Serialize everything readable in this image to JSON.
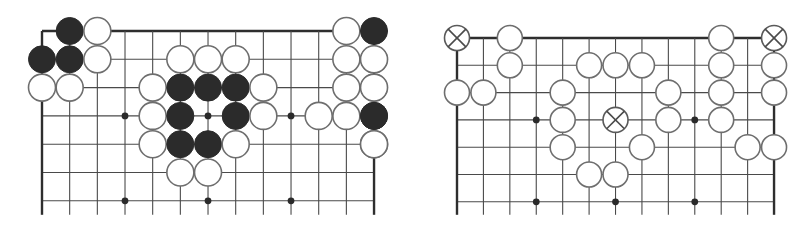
{
  "figure": {
    "colors": {
      "background": "#ffffff",
      "line": "#4a4a4a",
      "edge": "#2e2e2e",
      "black_stone": "#2b2b2b",
      "white_stone_fill": "#ffffff",
      "white_stone_stroke": "#6e6e6e"
    }
  },
  "boards": [
    {
      "name": "left-board",
      "cols": 13,
      "rows": 7,
      "origin_x": 42,
      "origin_y": 31,
      "dx": 27.67,
      "dy": 28.3,
      "line_extend_bottom": 14,
      "stone_radius": 13.5,
      "edges": [
        "top",
        "left",
        "right"
      ],
      "star_points": [
        [
          3,
          3
        ],
        [
          6,
          3
        ],
        [
          9,
          3
        ],
        [
          3,
          6
        ],
        [
          6,
          6
        ],
        [
          9,
          6
        ]
      ],
      "stones": [
        {
          "c": 1,
          "r": 0,
          "color": "black"
        },
        {
          "c": 2,
          "r": 0,
          "color": "white"
        },
        {
          "c": 11,
          "r": 0,
          "color": "white"
        },
        {
          "c": 12,
          "r": 0,
          "color": "black"
        },
        {
          "c": 0,
          "r": 1,
          "color": "black"
        },
        {
          "c": 1,
          "r": 1,
          "color": "black"
        },
        {
          "c": 2,
          "r": 1,
          "color": "white"
        },
        {
          "c": 5,
          "r": 1,
          "color": "white"
        },
        {
          "c": 6,
          "r": 1,
          "color": "white"
        },
        {
          "c": 7,
          "r": 1,
          "color": "white"
        },
        {
          "c": 11,
          "r": 1,
          "color": "white"
        },
        {
          "c": 12,
          "r": 1,
          "color": "black"
        },
        {
          "c": 13,
          "r": 1,
          "color": "white"
        },
        {
          "c": 0,
          "r": 2,
          "color": "white"
        },
        {
          "c": 1,
          "r": 2,
          "color": "white"
        },
        {
          "c": 4,
          "r": 2,
          "color": "white"
        },
        {
          "c": 5,
          "r": 2,
          "color": "black"
        },
        {
          "c": 6,
          "r": 2,
          "color": "black"
        },
        {
          "c": 7,
          "r": 2,
          "color": "black"
        },
        {
          "c": 8,
          "r": 2,
          "color": "white"
        },
        {
          "c": 11,
          "r": 2,
          "color": "white"
        },
        {
          "c": 12,
          "r": 2,
          "color": "black"
        },
        {
          "c": 13,
          "r": 2,
          "color": "white"
        },
        {
          "c": 4,
          "r": 3,
          "color": "white"
        },
        {
          "c": 5,
          "r": 3,
          "color": "black"
        },
        {
          "c": 7,
          "r": 3,
          "color": "black"
        },
        {
          "c": 8,
          "r": 3,
          "color": "white"
        },
        {
          "c": 10,
          "r": 3,
          "color": "white"
        },
        {
          "c": 11,
          "r": 3,
          "color": "white"
        },
        {
          "c": 12,
          "r": 3,
          "color": "black"
        },
        {
          "c": 13,
          "r": 3,
          "color": "black"
        },
        {
          "c": 4,
          "r": 4,
          "color": "white"
        },
        {
          "c": 5,
          "r": 4,
          "color": "black"
        },
        {
          "c": 6,
          "r": 4,
          "color": "black"
        },
        {
          "c": 7,
          "r": 4,
          "color": "white"
        },
        {
          "c": 12,
          "r": 4,
          "color": "white"
        },
        {
          "c": 13,
          "r": 4,
          "color": "white"
        },
        {
          "c": 5,
          "r": 5,
          "color": "white"
        },
        {
          "c": 6,
          "r": 5,
          "color": "white"
        }
      ]
    },
    {
      "name": "right-board",
      "cols": 13,
      "rows": 7,
      "origin_x": 457,
      "origin_y": 38,
      "dx": 26.42,
      "dy": 27.3,
      "line_extend_bottom": 13,
      "stone_radius": 12.5,
      "edges": [
        "top",
        "left",
        "right"
      ],
      "star_points": [
        [
          3,
          3
        ],
        [
          6,
          3
        ],
        [
          9,
          3
        ],
        [
          3,
          6
        ],
        [
          6,
          6
        ],
        [
          9,
          6
        ]
      ],
      "stones": [
        {
          "c": 0,
          "r": 0,
          "color": "cross"
        },
        {
          "c": 2,
          "r": 0,
          "color": "white"
        },
        {
          "c": 10,
          "r": 0,
          "color": "white"
        },
        {
          "c": 12,
          "r": 0,
          "color": "cross"
        },
        {
          "c": 2,
          "r": 1,
          "color": "white"
        },
        {
          "c": 5,
          "r": 1,
          "color": "white"
        },
        {
          "c": 6,
          "r": 1,
          "color": "white"
        },
        {
          "c": 7,
          "r": 1,
          "color": "white"
        },
        {
          "c": 10,
          "r": 1,
          "color": "white"
        },
        {
          "c": 12,
          "r": 1,
          "color": "white"
        },
        {
          "c": 0,
          "r": 2,
          "color": "white"
        },
        {
          "c": 1,
          "r": 2,
          "color": "white"
        },
        {
          "c": 4,
          "r": 2,
          "color": "white"
        },
        {
          "c": 8,
          "r": 2,
          "color": "white"
        },
        {
          "c": 10,
          "r": 2,
          "color": "white"
        },
        {
          "c": 12,
          "r": 2,
          "color": "white"
        },
        {
          "c": 4,
          "r": 3,
          "color": "white"
        },
        {
          "c": 6,
          "r": 3,
          "color": "cross"
        },
        {
          "c": 8,
          "r": 3,
          "color": "white"
        },
        {
          "c": 10,
          "r": 3,
          "color": "white"
        },
        {
          "c": 4,
          "r": 4,
          "color": "white"
        },
        {
          "c": 7,
          "r": 4,
          "color": "white"
        },
        {
          "c": 11,
          "r": 4,
          "color": "white"
        },
        {
          "c": 12,
          "r": 4,
          "color": "white"
        },
        {
          "c": 5,
          "r": 5,
          "color": "white"
        },
        {
          "c": 6,
          "r": 5,
          "color": "white"
        }
      ]
    }
  ]
}
